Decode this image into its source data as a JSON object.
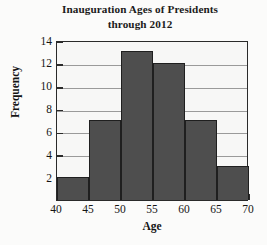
{
  "chart_data": {
    "type": "bar",
    "title": "Inauguration Ages of Presidents through 2012",
    "title_lines": [
      "Inauguration Ages of Presidents",
      "through 2012"
    ],
    "xlabel": "Age",
    "ylabel": "Frequency",
    "categories": [
      "40-45",
      "45-50",
      "50-55",
      "55-60",
      "60-65",
      "65-70"
    ],
    "bin_edges": [
      40,
      45,
      50,
      55,
      60,
      65,
      70
    ],
    "values": [
      2,
      7,
      13,
      12,
      7,
      3
    ],
    "xlim": [
      40,
      70
    ],
    "ylim": [
      0,
      14
    ],
    "x_ticks": [
      40,
      45,
      50,
      55,
      60,
      65,
      70
    ],
    "y_ticks": [
      2,
      4,
      6,
      8,
      10,
      12,
      14
    ],
    "gridlines": [
      2,
      4,
      6,
      8,
      10,
      12
    ],
    "grid": true,
    "legend": null,
    "colors": {
      "bar_fill": "#4e4e4e",
      "bar_edge": "#1f1f1f",
      "axis": "#2a2a2a",
      "grid": "#9a9a9a",
      "text": "#141414",
      "plot_background": "#f7f7f6",
      "figure_background": "#fbfbfa"
    }
  }
}
